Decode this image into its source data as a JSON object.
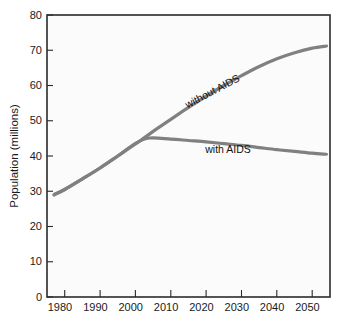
{
  "chart_data": {
    "type": "line",
    "title": "",
    "xlabel": "",
    "ylabel": "Population (millions)",
    "xlim": [
      1975,
      2055
    ],
    "ylim": [
      0,
      80
    ],
    "grid": false,
    "legend_position": "inline-labels",
    "xticks": [
      "1980",
      "1990",
      "2000",
      "2010",
      "2020",
      "2030",
      "2040",
      "2050"
    ],
    "xtick_values": [
      1980,
      1990,
      2000,
      2010,
      2020,
      2030,
      2040,
      2050
    ],
    "yticks": [
      "0",
      "10",
      "20",
      "30",
      "40",
      "50",
      "60",
      "70",
      "80"
    ],
    "ytick_values": [
      0,
      10,
      20,
      30,
      40,
      50,
      60,
      70,
      80
    ],
    "series": [
      {
        "name": "without AIDS",
        "label": "without AIDS",
        "color": "#808080",
        "x": [
          1977,
          1980,
          1985,
          1990,
          1995,
          2000,
          2005,
          2010,
          2015,
          2020,
          2025,
          2030,
          2035,
          2040,
          2045,
          2050,
          2054
        ],
        "values": [
          29.0,
          30.5,
          33.5,
          36.6,
          40.0,
          43.4,
          47.0,
          50.4,
          53.8,
          57.0,
          60.0,
          62.8,
          65.4,
          67.6,
          69.3,
          70.6,
          71.2
        ]
      },
      {
        "name": "with AIDS",
        "label": "with AIDS",
        "color": "#808080",
        "x": [
          1977,
          1980,
          1985,
          1990,
          1995,
          2000,
          2004,
          2010,
          2015,
          2020,
          2025,
          2030,
          2035,
          2040,
          2045,
          2050,
          2054
        ],
        "values": [
          29.0,
          30.5,
          33.5,
          36.6,
          40.0,
          43.6,
          45.1,
          44.8,
          44.4,
          44.0,
          43.5,
          43.0,
          42.4,
          41.8,
          41.3,
          40.8,
          40.5
        ]
      }
    ],
    "annotations": [
      {
        "text": "without AIDS",
        "x": 2012,
        "y": 57.5,
        "rotation": -28
      },
      {
        "text": "with AIDS",
        "x": 2024,
        "y": 42.0,
        "rotation": 0
      }
    ]
  }
}
